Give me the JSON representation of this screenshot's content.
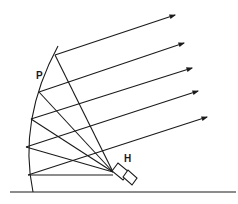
{
  "diagram": {
    "labels": {
      "reflector": "P",
      "horn": "H"
    },
    "colors": {
      "ink": "#1a1a1a",
      "background": "#ffffff"
    },
    "focus": [
      113,
      172
    ],
    "reflector_points": [
      [
        55,
        55
      ],
      [
        39,
        92
      ],
      [
        31,
        119
      ],
      [
        26,
        147
      ],
      [
        28,
        175
      ]
    ],
    "arrow_tips": [
      [
        175,
        15
      ],
      [
        184,
        43
      ],
      [
        192,
        68
      ],
      [
        198,
        91
      ],
      [
        207,
        117
      ]
    ]
  }
}
